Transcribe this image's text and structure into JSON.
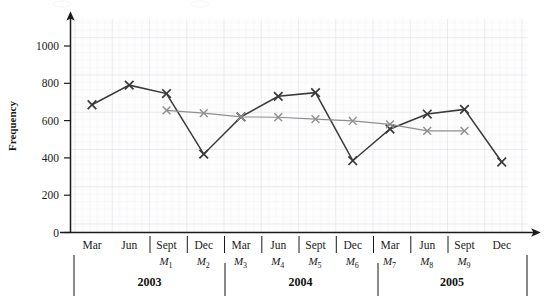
{
  "chart_data": {
    "type": "line",
    "title": "",
    "xlabel": "",
    "ylabel": "Frequency",
    "ylim": [
      0,
      1100
    ],
    "yticks": [
      0,
      200,
      400,
      600,
      800,
      1000
    ],
    "ytick_labels": [
      "0",
      "200",
      "400",
      "600",
      "800",
      "1000"
    ],
    "grid": true,
    "legend_position": "none",
    "x_categories": [
      "Mar",
      "Jun",
      "Sept",
      "Dec",
      "Mar",
      "Jun",
      "Sept",
      "Dec",
      "Mar",
      "Jun",
      "Sept",
      "Dec"
    ],
    "x_sub_labels": [
      "M1",
      "M2",
      "M3",
      "M4",
      "M5",
      "M6",
      "M7",
      "M8",
      "M9"
    ],
    "x_sub_labels_display": [
      "M",
      "M",
      "M",
      "M",
      "M",
      "M",
      "M",
      "M",
      "M"
    ],
    "x_sub_indices": [
      "1",
      "2",
      "3",
      "4",
      "5",
      "6",
      "7",
      "8",
      "9"
    ],
    "year_groups": [
      {
        "label": "2003",
        "start": "Mar",
        "end": "Dec"
      },
      {
        "label": "2004",
        "start": "Mar",
        "end": "Dec"
      },
      {
        "label": "2005",
        "start": "Mar",
        "end": "Dec"
      }
    ],
    "series": [
      {
        "name": "observed",
        "color": "#3a3a3a",
        "marker": "x",
        "x": [
          "Mar 2003",
          "Jun 2003",
          "Sept 2003",
          "Dec 2003",
          "Mar 2004",
          "Jun 2004",
          "Sept 2004",
          "Dec 2004",
          "Mar 2005",
          "Jun 2005",
          "Sept 2005",
          "Dec 2005"
        ],
        "values": [
          685,
          790,
          745,
          420,
          620,
          730,
          750,
          385,
          555,
          635,
          660,
          378
        ]
      },
      {
        "name": "trend",
        "color": "#8e8e8e",
        "marker": "x",
        "x": [
          "Sept 2003",
          "Dec 2003",
          "Mar 2004",
          "Jun 2004",
          "Sept 2004",
          "Dec 2004",
          "Mar 2005",
          "Jun 2005"
        ],
        "values": [
          655,
          640,
          620,
          618,
          608,
          598,
          580,
          545
        ],
        "extra_points": [
          {
            "x": "Sept 2005",
            "value": 545
          }
        ]
      }
    ]
  },
  "annotations": {
    "top_cut_text_left": "",
    "top_cut_text_right": ""
  }
}
